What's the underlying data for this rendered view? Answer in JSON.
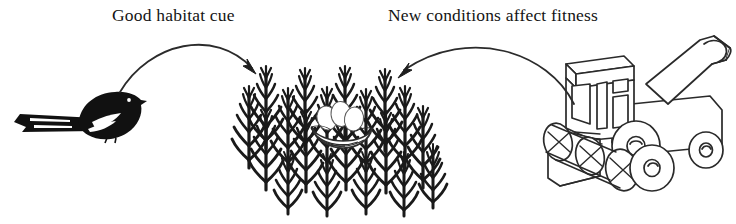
{
  "figure": {
    "background_color": "#ffffff",
    "ink_color": "#141414",
    "width": 736,
    "height": 224
  },
  "labels": {
    "left_caption": "Good habitat cue",
    "right_caption": "New conditions affect fitness"
  },
  "elements": {
    "bird": {
      "name": "magpie-silhouette",
      "fill": "#111111",
      "description": "black magpie bird facing right with long striped tail"
    },
    "crop_field": {
      "name": "crop-field",
      "fill": "#1a1a1a",
      "rows": 4,
      "stalks_per_row": 5,
      "description": "staggered rows of dark cereal crop stalks"
    },
    "nest": {
      "name": "nest-with-eggs",
      "egg_count": 3,
      "fill": "#ffffff",
      "stroke": "#333333",
      "description": "white nest containing eggs hidden among the crops"
    },
    "combine": {
      "name": "combine-harvester",
      "fill": "#ffffff",
      "stroke": "#2a2a2a",
      "description": "line-art combine harvester with header reel and unloading auger"
    },
    "arrow_left": {
      "name": "arrow-bird-to-field",
      "from": "bird",
      "to": "crop-field",
      "direction": "rightward-arc"
    },
    "arrow_right": {
      "name": "arrow-combine-to-field",
      "from": "combine-harvester",
      "to": "crop-field",
      "direction": "leftward-arc"
    }
  }
}
